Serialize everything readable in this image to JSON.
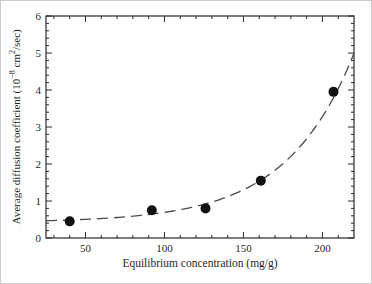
{
  "figure": {
    "xlabel": "Equilibrium concentration (mg/g)",
    "ylabel_parts": {
      "pre": "Average diffusion coefficient (10",
      "sup1": "−8",
      "mid": " cm",
      "sup2": "2",
      "post": "/sec)"
    }
  },
  "chart_data": {
    "type": "scatter",
    "title": "",
    "xlabel": "Equilibrium concentration (mg/g)",
    "ylabel": "Average diffusion coefficient (10^-8 cm^2/sec)",
    "xlim": [
      25,
      220
    ],
    "ylim": [
      0,
      6
    ],
    "x_major_ticks": [
      50,
      100,
      150,
      200
    ],
    "x_minor_tick_step": 10,
    "y_major_ticks": [
      0,
      1,
      2,
      3,
      4,
      5,
      6
    ],
    "y_minor_tick_step": 0.2,
    "grid": false,
    "legend": false,
    "frame": "box-with-inward-ticks",
    "points": [
      {
        "x": 40,
        "y": 0.45
      },
      {
        "x": 92,
        "y": 0.75
      },
      {
        "x": 126,
        "y": 0.8
      },
      {
        "x": 161,
        "y": 1.55
      },
      {
        "x": 207,
        "y": 3.95
      }
    ],
    "trend_curve": {
      "style": "dashed",
      "x_range": [
        25,
        220
      ],
      "fit": {
        "form": "a + b*exp(c*x)",
        "a": 0.42,
        "b": 0.026,
        "c": 0.0235
      },
      "end_values": {
        "at_x_min": 0.47,
        "at_x_max": 5.0
      }
    },
    "style": {
      "point_color": "#111111",
      "curve_color": "#4a4a4a",
      "axis_color": "#2b2b2b",
      "text_color": "#1f1f1f",
      "background": "#ffffff"
    }
  }
}
